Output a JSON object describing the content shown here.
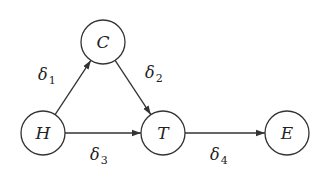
{
  "diagram": {
    "type": "directed-graph",
    "colors": {
      "stroke": "#333333",
      "text": "#222222",
      "background": "#ffffff"
    },
    "nodes": [
      {
        "id": "C",
        "label": "C",
        "cx": 103,
        "cy": 42,
        "r": 22
      },
      {
        "id": "H",
        "label": "H",
        "cx": 43,
        "cy": 133,
        "r": 22
      },
      {
        "id": "T",
        "label": "T",
        "cx": 163,
        "cy": 133,
        "r": 22
      },
      {
        "id": "E",
        "label": "E",
        "cx": 287,
        "cy": 133,
        "r": 22
      }
    ],
    "edges": [
      {
        "from": "H",
        "to": "C",
        "label": "δ",
        "sub": "1",
        "lx": 38,
        "ly": 80
      },
      {
        "from": "C",
        "to": "T",
        "label": "δ",
        "sub": "2",
        "lx": 145,
        "ly": 78
      },
      {
        "from": "H",
        "to": "T",
        "label": "δ",
        "sub": "3",
        "lx": 90,
        "ly": 160
      },
      {
        "from": "T",
        "to": "E",
        "label": "δ",
        "sub": "4",
        "lx": 210,
        "ly": 160
      }
    ]
  }
}
